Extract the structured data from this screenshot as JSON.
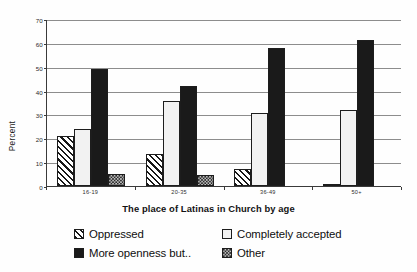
{
  "chart_data": {
    "type": "bar",
    "title": "",
    "subtitle": "",
    "xlabel": "The place of Latinas in Church by age",
    "ylabel": "Percent",
    "categories": [
      "16-19",
      "20-35",
      "36-49",
      "50+"
    ],
    "series": [
      {
        "name": "Oppressed",
        "pattern": "diagonal-hatch",
        "values": [
          21,
          13.5,
          7,
          1
        ]
      },
      {
        "name": "Completely accepted",
        "pattern": "light-dots",
        "values": [
          24,
          35.5,
          30.5,
          32
        ]
      },
      {
        "name": "More openness but..",
        "pattern": "solid-black",
        "values": [
          49,
          42,
          58,
          61
        ]
      },
      {
        "name": "Other",
        "pattern": "dark-checker",
        "values": [
          5,
          4.5,
          0,
          0
        ]
      }
    ],
    "ylim": [
      0,
      70
    ],
    "yticks": [
      0,
      10,
      20,
      30,
      40,
      50,
      60,
      70
    ],
    "ytick_labels": [
      "0",
      "10",
      "20",
      "30",
      "40",
      "50",
      "60",
      "70"
    ],
    "grid": true,
    "grid_axis": "y",
    "legend_position": "below-axis",
    "legend": [
      {
        "label": "Oppressed",
        "swatch": "diagonal-hatch"
      },
      {
        "label": "Completely accepted",
        "swatch": "light-dots"
      },
      {
        "label": "More openness but..",
        "swatch": "solid-black"
      },
      {
        "label": "Other",
        "swatch": "dark-checker"
      }
    ],
    "colors": {
      "bar_outline": "#1d1d1d",
      "solid_fill": "#1a1a1a",
      "dots_fill": "#f2f2f2",
      "checker_fill": "#2a2a2a",
      "gridline": "#8d8d8d",
      "axis": "#3a3a3a",
      "background": "#fefefe"
    }
  }
}
